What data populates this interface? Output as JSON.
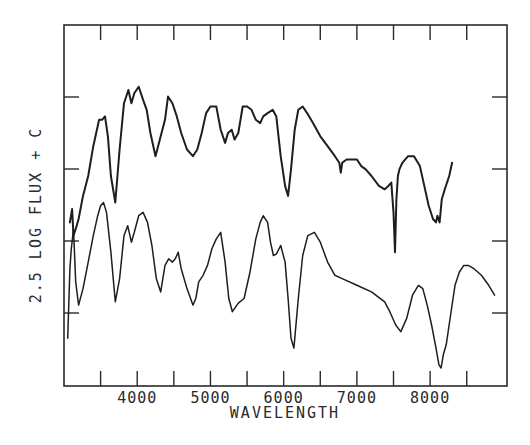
{
  "chart_data": {
    "type": "line",
    "title": "",
    "xlabel": "WAVELENGTH",
    "ylabel": "2.5 LOG FLUX + C",
    "xlim": [
      3000,
      9050
    ],
    "x_tick_labels": [
      "4000",
      "5000",
      "6000",
      "7000",
      "8000"
    ],
    "x_major_ticks": [
      3500,
      4000,
      4500,
      5000,
      5500,
      6000,
      6500,
      7000,
      7500,
      8000,
      8500
    ],
    "y_ticks_relative": [
      1,
      2,
      3,
      4
    ],
    "ylim_relative": [
      0,
      5
    ],
    "grid": false,
    "legend": null,
    "series": [
      {
        "name": "upper spectrum (noisy, higher resolution)",
        "x": [
          3080,
          3110,
          3130,
          3160,
          3200,
          3260,
          3330,
          3400,
          3480,
          3520,
          3560,
          3600,
          3640,
          3700,
          3760,
          3820,
          3880,
          3920,
          3960,
          4020,
          4080,
          4130,
          4180,
          4250,
          4320,
          4380,
          4420,
          4480,
          4540,
          4600,
          4680,
          4760,
          4820,
          4880,
          4940,
          5000,
          5080,
          5140,
          5200,
          5240,
          5290,
          5330,
          5380,
          5440,
          5500,
          5560,
          5620,
          5680,
          5720,
          5780,
          5850,
          5900,
          5960,
          6020,
          6060,
          6100,
          6150,
          6200,
          6260,
          6320,
          6400,
          6500,
          6600,
          6700,
          6760,
          6780,
          6800,
          6860,
          6940,
          7000,
          7060,
          7120,
          7200,
          7300,
          7380,
          7430,
          7470,
          7500,
          7520,
          7540,
          7560,
          7580,
          7620,
          7700,
          7780,
          7860,
          7920,
          7980,
          8040,
          8080,
          8100,
          8130,
          8160,
          8200,
          8260,
          8300
        ],
        "y": [
          2.2,
          2.4,
          2.0,
          2.1,
          2.25,
          2.6,
          2.9,
          3.35,
          3.75,
          3.75,
          3.8,
          3.5,
          2.9,
          2.5,
          3.3,
          4.0,
          4.2,
          4.0,
          4.15,
          4.25,
          4.05,
          3.9,
          3.55,
          3.2,
          3.5,
          3.75,
          4.1,
          4.0,
          3.8,
          3.55,
          3.3,
          3.2,
          3.3,
          3.55,
          3.85,
          3.95,
          3.95,
          3.6,
          3.4,
          3.55,
          3.6,
          3.45,
          3.55,
          3.95,
          3.95,
          3.9,
          3.75,
          3.7,
          3.8,
          3.85,
          3.9,
          3.8,
          3.2,
          2.75,
          2.6,
          3.0,
          3.6,
          3.9,
          3.95,
          3.85,
          3.7,
          3.5,
          3.35,
          3.2,
          3.1,
          2.95,
          3.1,
          3.15,
          3.15,
          3.15,
          3.05,
          3.0,
          2.9,
          2.75,
          2.7,
          2.75,
          2.8,
          2.35,
          1.75,
          2.55,
          2.9,
          3.0,
          3.1,
          3.2,
          3.2,
          3.05,
          2.75,
          2.45,
          2.25,
          2.2,
          2.3,
          2.2,
          2.55,
          2.7,
          2.9,
          3.1
        ]
      },
      {
        "name": "lower spectrum (smooth)",
        "x": [
          3050,
          3080,
          3100,
          3130,
          3160,
          3200,
          3260,
          3330,
          3400,
          3460,
          3500,
          3540,
          3580,
          3640,
          3700,
          3760,
          3820,
          3870,
          3920,
          3960,
          4020,
          4080,
          4140,
          4200,
          4260,
          4320,
          4380,
          4430,
          4480,
          4520,
          4560,
          4600,
          4680,
          4760,
          4800,
          4840,
          4900,
          4960,
          5020,
          5080,
          5140,
          5200,
          5250,
          5300,
          5380,
          5460,
          5540,
          5620,
          5680,
          5720,
          5780,
          5820,
          5860,
          5900,
          5960,
          6020,
          6060,
          6100,
          6140,
          6200,
          6260,
          6330,
          6420,
          6500,
          6600,
          6700,
          6800,
          7000,
          7200,
          7380,
          7450,
          7530,
          7600,
          7680,
          7760,
          7840,
          7900,
          7960,
          8020,
          8080,
          8120,
          8150,
          8180,
          8220,
          8280,
          8340,
          8400,
          8460,
          8520,
          8600,
          8700,
          8800,
          8880
        ],
        "y": [
          0.45,
          1.5,
          1.8,
          2.1,
          1.3,
          0.95,
          1.2,
          1.6,
          2.0,
          2.3,
          2.45,
          2.5,
          2.35,
          1.75,
          1.0,
          1.35,
          2.0,
          2.15,
          1.9,
          2.05,
          2.3,
          2.35,
          2.2,
          1.85,
          1.35,
          1.15,
          1.55,
          1.65,
          1.6,
          1.65,
          1.75,
          1.5,
          1.2,
          0.95,
          1.05,
          1.3,
          1.4,
          1.55,
          1.8,
          1.95,
          2.05,
          1.6,
          1.05,
          0.85,
          0.98,
          1.05,
          1.45,
          1.95,
          2.2,
          2.3,
          2.2,
          1.9,
          1.7,
          1.72,
          1.85,
          1.6,
          1.05,
          0.45,
          0.3,
          1.05,
          1.7,
          2.0,
          2.05,
          1.9,
          1.6,
          1.4,
          1.35,
          1.25,
          1.15,
          1.0,
          0.85,
          0.65,
          0.55,
          0.75,
          1.1,
          1.25,
          1.2,
          0.95,
          0.65,
          0.3,
          0.05,
          0.0,
          0.2,
          0.35,
          0.8,
          1.25,
          1.45,
          1.55,
          1.55,
          1.5,
          1.4,
          1.25,
          1.1
        ]
      }
    ]
  },
  "axes": {
    "x_label": "WAVELENGTH",
    "y_label": "2.5 LOG FLUX + C",
    "x_tick_labels": [
      "4000",
      "5000",
      "6000",
      "7000",
      "8000"
    ]
  },
  "colors": {
    "ink": "#1e1e1e",
    "paper": "#ffffff"
  }
}
